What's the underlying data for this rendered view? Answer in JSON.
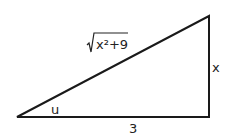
{
  "diagram": {
    "type": "right-triangle",
    "hypotenuse_label": "x²+9",
    "hypotenuse_radical": "√",
    "opposite_label": "x",
    "adjacent_label": "3",
    "angle_label": "u",
    "stroke_color": "#1a1a1a"
  }
}
